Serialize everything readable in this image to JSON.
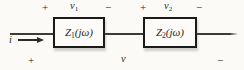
{
  "colors": {
    "background": "#fbfaf6",
    "ink": "#1a1a1a",
    "wire": "#3b3b3b"
  },
  "diagram_type": "series-impedance-circuit",
  "boxes": {
    "z1": {
      "symbol": "Z",
      "subscript": "1",
      "argument": "(jω)"
    },
    "z2": {
      "symbol": "Z",
      "subscript": "2",
      "argument": "(jω)"
    }
  },
  "voltages": {
    "v1": {
      "plus": "+",
      "symbol": "v",
      "subscript": "1",
      "minus": "−"
    },
    "v2": {
      "plus": "+",
      "symbol": "v",
      "subscript": "2",
      "minus": "−"
    },
    "v": {
      "plus": "+",
      "symbol": "v",
      "minus": "−"
    }
  },
  "current": {
    "symbol": "i"
  }
}
